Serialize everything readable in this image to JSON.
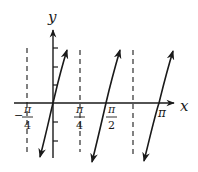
{
  "figure": {
    "function": "y = tan(2x)",
    "axes": {
      "x_label": "x",
      "y_label": "y"
    },
    "x_tick_labels": [
      {
        "id": "neg-pi-over-4",
        "num": "π",
        "den": "4",
        "sign": "−",
        "value": -0.7854
      },
      {
        "id": "pi-over-4",
        "num": "π",
        "den": "4",
        "sign": "",
        "value": 0.7854
      },
      {
        "id": "pi-over-2",
        "num": "π",
        "den": "2",
        "sign": "",
        "value": 1.5708
      },
      {
        "id": "pi",
        "text": "π",
        "value": 3.1416
      }
    ],
    "asymptotes": [
      "x = −π/4",
      "x = π/4",
      "x = 3π/4"
    ],
    "branches": [
      {
        "center": "0",
        "from": [
          -0.6,
          -3
        ],
        "to": [
          0.6,
          3
        ]
      },
      {
        "center": "π/2",
        "from": [
          0.97,
          -3
        ],
        "to": [
          2.17,
          3
        ]
      },
      {
        "center": "π",
        "from": [
          2.54,
          -3
        ],
        "to": [
          3.74,
          3
        ]
      }
    ],
    "colors": {
      "ink": "#1a1a1a",
      "background": "#ffffff"
    }
  }
}
